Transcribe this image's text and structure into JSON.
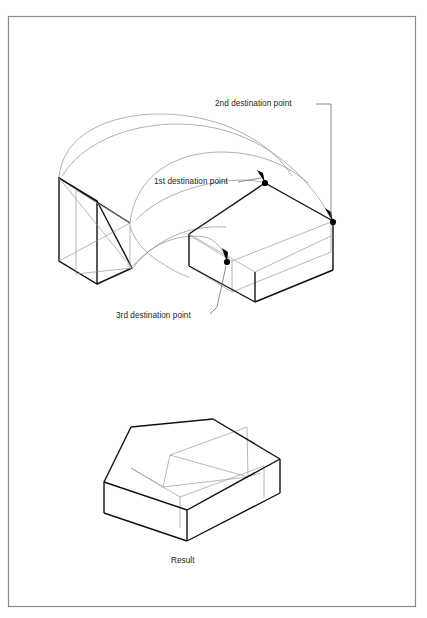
{
  "figure": {
    "title_caption": "Result",
    "annotations": [
      {
        "id": "first",
        "label": "1st destination point"
      },
      {
        "id": "second",
        "label": "2nd destination point"
      },
      {
        "id": "third",
        "label": "3rd destination point"
      }
    ],
    "colors": {
      "background": "#ffffff",
      "frame_border": "#8c8c8c",
      "outline_heavy": "#111111",
      "outline_light": "#8e8e8e",
      "leader_line": "#6f6f6f",
      "marker": "#000000",
      "text": "#1c1c1c"
    },
    "frame": {
      "x": 8,
      "y": 16,
      "width": 408,
      "height": 591
    },
    "diagram_type": "isometric-technical-illustration",
    "description_parts": {
      "upper": "curved elbow solid and open box with three marked destination points",
      "lower": "resulting merged solid"
    }
  }
}
